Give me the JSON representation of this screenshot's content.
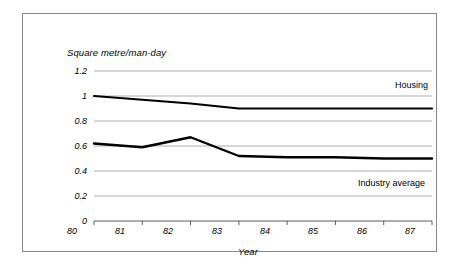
{
  "chart_data": {
    "type": "line",
    "title": "",
    "xlabel": "Year",
    "ylabel": "Square metre/man-day",
    "x": [
      "80",
      "81",
      "82",
      "83",
      "84",
      "85",
      "86",
      "87"
    ],
    "xlim": [
      80,
      87
    ],
    "ylim": [
      0,
      1.2
    ],
    "yticks": [
      "0",
      "0.2",
      "0.4",
      "0.6",
      "0.8",
      "1",
      "1.2"
    ],
    "ytick_values": [
      0,
      0.2,
      0.4,
      0.6,
      0.8,
      1.0,
      1.2
    ],
    "grid": "horizontal",
    "legend": "inline-labels",
    "series": [
      {
        "name": "Housing",
        "values": [
          1.0,
          0.97,
          0.94,
          0.9,
          0.9,
          0.9,
          0.9,
          0.9
        ],
        "color": "#000000"
      },
      {
        "name": "Industry average",
        "values": [
          0.62,
          0.59,
          0.67,
          0.52,
          0.51,
          0.51,
          0.5,
          0.5
        ],
        "color": "#000000"
      }
    ],
    "annotations": [
      {
        "text": "Housing",
        "series": "Housing"
      },
      {
        "text": "Industry average",
        "series": "Industry average"
      }
    ]
  },
  "colors": {
    "line": "#000000",
    "grid": "#9a9a9a",
    "axis": "#4a4a4a",
    "border": "#8a8a8a",
    "background": "#ffffff"
  }
}
